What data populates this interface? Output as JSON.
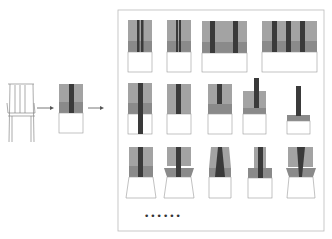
{
  "diagram": {
    "colors": {
      "light_gray": "#a3a3a3",
      "mid_gray": "#8a8a8a",
      "dark_bar": "#3a3a3a",
      "outline": "#999999",
      "panel_border": "#bbbbbb"
    },
    "source": {
      "label": "chair-sketch"
    },
    "abstraction": {
      "label": "base-block"
    },
    "ellipsis": "••••••",
    "variations": {
      "row1": [
        "two-bars-narrow",
        "two-bars-close",
        "two-bars-wide",
        "three-bars-wide"
      ],
      "row2": [
        "bar-extends-down",
        "bar-full-back",
        "short-bar",
        "bar-above-back",
        "bar-on-thin-seat"
      ],
      "row3": [
        "tapered-seat",
        "flared-seat",
        "tapered-bar",
        "narrow-top",
        "tapered-bar-flared"
      ]
    }
  }
}
